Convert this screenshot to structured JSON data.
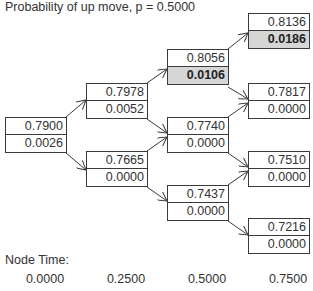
{
  "title": "Probability of up move, p = 0.5000",
  "nodes": {
    "n00": {
      "top": "0.7900",
      "bottom": "0.0026"
    },
    "n10": {
      "top": "0.7978",
      "bottom": "0.0052"
    },
    "n11": {
      "top": "0.7665",
      "bottom": "0.0000"
    },
    "n20": {
      "top": "0.8056",
      "bottom": "0.0106"
    },
    "n21": {
      "top": "0.7740",
      "bottom": "0.0000"
    },
    "n22": {
      "top": "0.7437",
      "bottom": "0.0000"
    },
    "n30": {
      "top": "0.8136",
      "bottom": "0.0186"
    },
    "n31": {
      "top": "0.7817",
      "bottom": "0.0000"
    },
    "n32": {
      "top": "0.7510",
      "bottom": "0.0000"
    },
    "n33": {
      "top": "0.7216",
      "bottom": "0.0000"
    }
  },
  "highlighted_nodes": [
    "n20",
    "n30"
  ],
  "node_time": {
    "label": "Node Time:",
    "values": [
      "0.0000",
      "0.2500",
      "0.5000",
      "0.7500"
    ]
  },
  "colors": {
    "border": "#3a3a3a",
    "highlight": "#d6d6d6",
    "text": "#333333"
  }
}
